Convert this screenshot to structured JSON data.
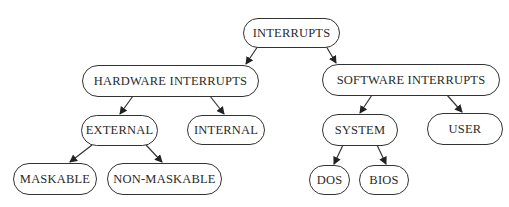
{
  "diagram": {
    "type": "tree",
    "title": "",
    "colors": {
      "background": "#ffffff",
      "stroke": "#333333",
      "text": "#2a2a2a"
    },
    "nodes": {
      "interrupts": {
        "label": "INTERRUPTS",
        "x": 243,
        "y": 18,
        "w": 97,
        "h": 30
      },
      "hardware": {
        "label": "HARDWARE INTERRUPTS",
        "x": 82,
        "y": 65,
        "w": 177,
        "h": 32
      },
      "software": {
        "label": "SOFTWARE INTERRUPTS",
        "x": 322,
        "y": 64,
        "w": 178,
        "h": 32
      },
      "external": {
        "label": "EXTERNAL",
        "x": 81,
        "y": 115,
        "w": 77,
        "h": 31
      },
      "internal": {
        "label": "INTERNAL",
        "x": 187,
        "y": 115,
        "w": 78,
        "h": 30
      },
      "system": {
        "label": "SYSTEM",
        "x": 322,
        "y": 114,
        "w": 76,
        "h": 32
      },
      "user": {
        "label": "USER",
        "x": 427,
        "y": 113,
        "w": 76,
        "h": 32
      },
      "maskable": {
        "label": "MASKABLE",
        "x": 13,
        "y": 163,
        "w": 84,
        "h": 32
      },
      "nonmaskable": {
        "label": "NON-MASKABLE",
        "x": 107,
        "y": 163,
        "w": 115,
        "h": 32
      },
      "dos": {
        "label": "DOS",
        "x": 309,
        "y": 165,
        "w": 41,
        "h": 30
      },
      "bios": {
        "label": "BIOS",
        "x": 359,
        "y": 165,
        "w": 50,
        "h": 30
      }
    },
    "edges": [
      {
        "from": "interrupts",
        "to": "hardware",
        "x1": 258,
        "y1": 46,
        "x2": 246,
        "y2": 64
      },
      {
        "from": "interrupts",
        "to": "software",
        "x1": 326,
        "y1": 46,
        "x2": 336,
        "y2": 63
      },
      {
        "from": "hardware",
        "to": "external",
        "x1": 133,
        "y1": 96,
        "x2": 120,
        "y2": 114
      },
      {
        "from": "hardware",
        "to": "internal",
        "x1": 210,
        "y1": 96,
        "x2": 224,
        "y2": 114
      },
      {
        "from": "software",
        "to": "system",
        "x1": 372,
        "y1": 95,
        "x2": 360,
        "y2": 113
      },
      {
        "from": "software",
        "to": "user",
        "x1": 447,
        "y1": 95,
        "x2": 462,
        "y2": 112
      },
      {
        "from": "external",
        "to": "maskable",
        "x1": 92,
        "y1": 145,
        "x2": 70,
        "y2": 162
      },
      {
        "from": "external",
        "to": "nonmaskable",
        "x1": 146,
        "y1": 145,
        "x2": 162,
        "y2": 162
      },
      {
        "from": "system",
        "to": "dos",
        "x1": 343,
        "y1": 145,
        "x2": 334,
        "y2": 164
      },
      {
        "from": "system",
        "to": "bios",
        "x1": 377,
        "y1": 145,
        "x2": 386,
        "y2": 164
      }
    ]
  }
}
